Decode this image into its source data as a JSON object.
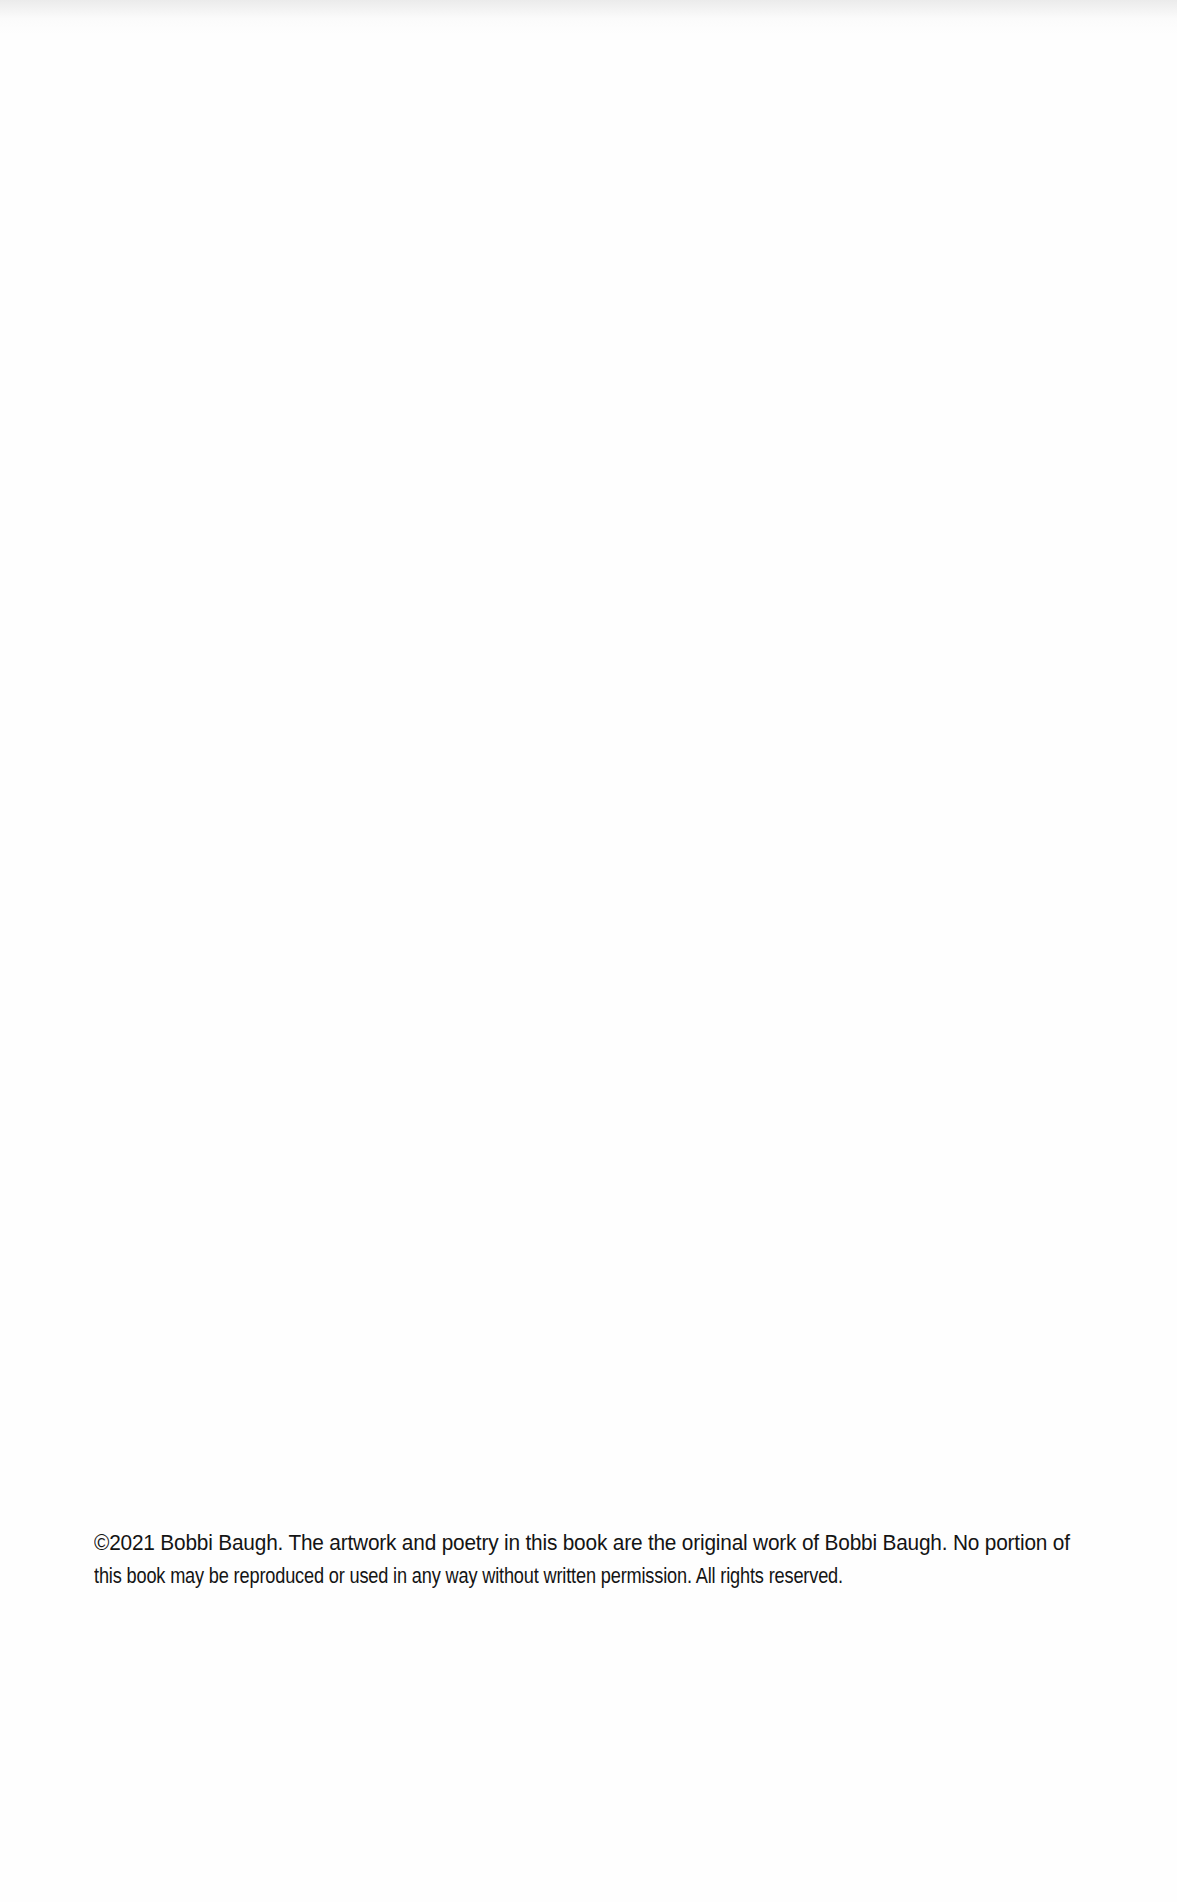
{
  "document": {
    "type": "copyright-page",
    "copyright_notice": {
      "lines": [
        "©2021  Bobbi Baugh. The artwork and poetry in this book are the original work of Bobbi Baugh. No portion of",
        "this book may be reproduced or used in any way without written permission. All rights reserved."
      ],
      "full_text": "©2021 Bobbi Baugh. The artwork and poetry in this book are the original work of Bobbi Baugh. No portion of this book may be reproduced or used in any way without written permission. All rights reserved."
    },
    "colors": {
      "background": "#fefefe",
      "text": "#141414"
    }
  }
}
